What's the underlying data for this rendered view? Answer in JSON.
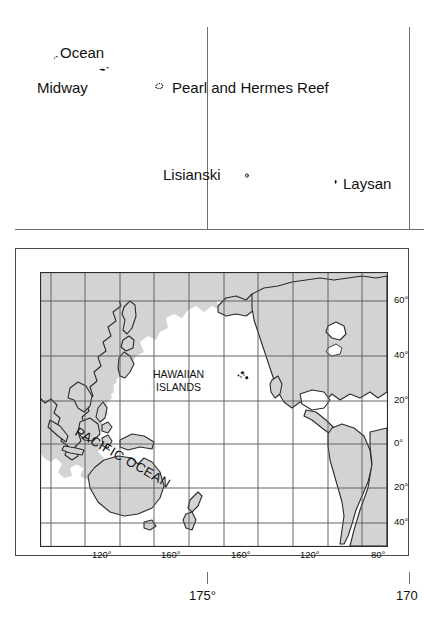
{
  "detail_map": {
    "name": "northwestern-hawaiian-islands-detail",
    "labels": [
      {
        "text": "Ocean",
        "x": 60,
        "y": 45
      },
      {
        "text": "Midway",
        "x": 37,
        "y": 80
      },
      {
        "text": "Pearl and Hermes Reef",
        "x": 172,
        "y": 80
      },
      {
        "text": "Lisianski",
        "x": 163,
        "y": 167
      },
      {
        "text": "Laysan",
        "x": 343,
        "y": 176
      }
    ],
    "islets": [
      {
        "name": "ocean-island-marker",
        "x": 56,
        "y": 57
      },
      {
        "name": "midway-atoll-marker",
        "x": 103,
        "y": 71
      },
      {
        "name": "pearl-hermes-marker",
        "x": 157,
        "y": 85
      },
      {
        "name": "lisianski-marker",
        "x": 246,
        "y": 175
      },
      {
        "name": "laysan-marker",
        "x": 336,
        "y": 181
      }
    ],
    "graticule": {
      "vertical_x": [
        207,
        409
      ],
      "horizontal_y": [
        229
      ]
    }
  },
  "locator_inset": {
    "name": "pacific-ocean-locator-map",
    "ocean_label": "PACIFIC OCEAN",
    "region_label_line1": "HAWAIIAN",
    "region_label_line2": "ISLANDS",
    "longitude_labels": [
      {
        "text": "120°",
        "x": 62
      },
      {
        "text": "160°",
        "x": 131
      },
      {
        "text": "160°",
        "x": 201
      },
      {
        "text": "120°",
        "x": 270
      },
      {
        "text": "80°",
        "x": 339
      }
    ],
    "latitude_labels": [
      {
        "text": "60°",
        "y": 29
      },
      {
        "text": "40°",
        "y": 84
      },
      {
        "text": "20°",
        "y": 129
      },
      {
        "text": "0°",
        "y": 172
      },
      {
        "text": "20°",
        "y": 216
      },
      {
        "text": "40°",
        "y": 251
      }
    ],
    "colors": {
      "land_fill": "#d3d3d3",
      "coastline": "#2b2b2b",
      "graticule": "#555555",
      "frame": "#2b2b2b"
    }
  },
  "outer_scale": {
    "name": "longitude-scale-bar",
    "labels": [
      {
        "text": "175°",
        "x": 207
      },
      {
        "text": "170",
        "x": 409
      }
    ],
    "ticks_x": [
      207,
      409
    ]
  }
}
